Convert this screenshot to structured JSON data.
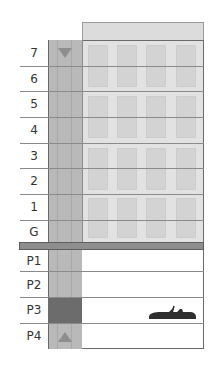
{
  "building": {
    "floors": [
      {
        "label": "7"
      },
      {
        "label": "6"
      },
      {
        "label": "5"
      },
      {
        "label": "4"
      },
      {
        "label": "3"
      },
      {
        "label": "2"
      },
      {
        "label": "1"
      },
      {
        "label": "G"
      }
    ],
    "parking_levels": [
      {
        "label": "P1"
      },
      {
        "label": "P2"
      },
      {
        "label": "P3",
        "has_car": true
      },
      {
        "label": "P4"
      }
    ]
  },
  "elevator": {
    "current_level": "P3",
    "up_indicator": "triangle-up",
    "down_indicator": "triangle-down"
  },
  "colors": {
    "shaft": "#b9b9b9",
    "elevator_car": "#6c6c6c",
    "building": "#e2e2e2",
    "ground": "#8e8e8e",
    "car_icon": "#2e2e2e"
  }
}
